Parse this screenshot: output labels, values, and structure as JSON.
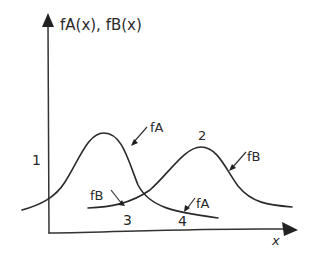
{
  "diagram": {
    "y_axis_label": "fA(x), fB(x)",
    "x_axis_label": "x",
    "curves": [
      {
        "name": "fA",
        "label": "fA",
        "description": "left bell curve, peak near region 1",
        "peak_region": "1"
      },
      {
        "name": "fB",
        "label": "fB",
        "description": "right bell curve, peak near region 2",
        "peak_region": "2"
      }
    ],
    "curve_labels": {
      "fA_upper": "fA",
      "fB_upper": "fB",
      "fB_lower": "fB",
      "fA_lower": "fA"
    },
    "regions": {
      "r1": "1",
      "r2": "2",
      "r3": "3",
      "r4": "4"
    },
    "colors": {
      "ink": "#2a2a2a",
      "background": "#ffffff"
    }
  }
}
